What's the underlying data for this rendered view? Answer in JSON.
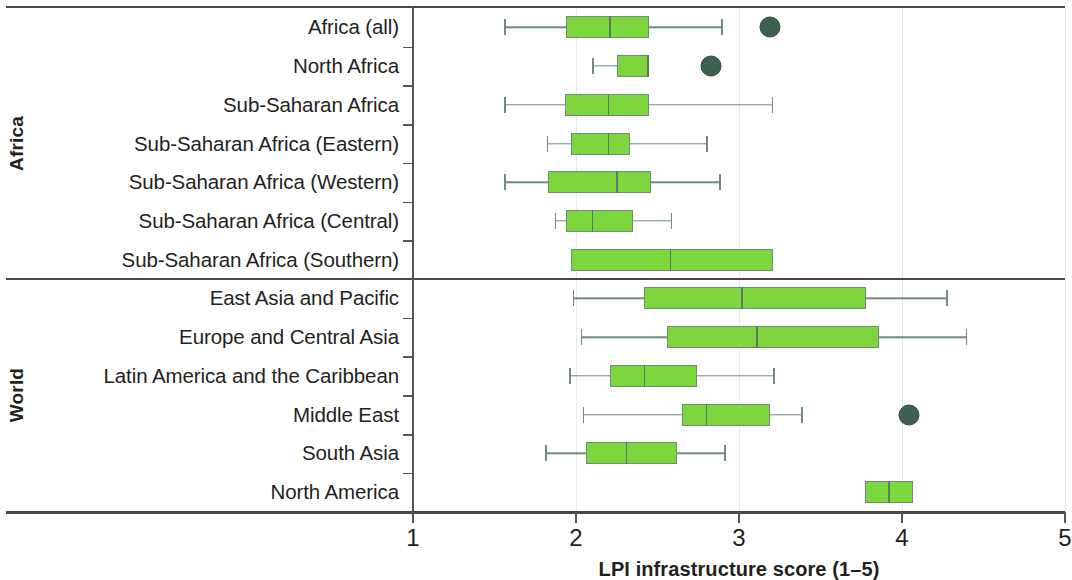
{
  "chart_data": {
    "type": "box",
    "title": "",
    "xlabel": "LPI infrastructure score (1–5)",
    "ylabel": "",
    "xlim": [
      1,
      5
    ],
    "xticks": [
      1,
      2,
      3,
      4,
      5
    ],
    "xticklabels": [
      "1",
      "2",
      "3",
      "4",
      "5"
    ],
    "grid": "vertical",
    "orientation": "horizontal",
    "colors": {
      "box_fill": "#7ed63f",
      "box_edge": "#6f8c78",
      "whisker": "#6f8c78",
      "median": "#5a7a62",
      "outlier": "#3c6150",
      "frame": "#4a4542",
      "gridline": "#e9e9ee"
    },
    "groups": [
      {
        "label": "Africa",
        "categories": [
          {
            "label": "Africa (all)",
            "whisker_low": 1.56,
            "q1": 1.94,
            "median": 2.21,
            "q3": 2.45,
            "whisker_high": 2.9,
            "outliers": [
              3.19
            ]
          },
          {
            "label": "North Africa",
            "whisker_low": 2.1,
            "q1": 2.25,
            "median": 2.44,
            "q3": 2.45,
            "whisker_high": 2.45,
            "outliers": [
              2.83
            ]
          },
          {
            "label": "Sub-Saharan Africa",
            "whisker_low": 1.56,
            "q1": 1.93,
            "median": 2.2,
            "q3": 2.45,
            "whisker_high": 3.21,
            "outliers": []
          },
          {
            "label": "Sub-Saharan Africa (Eastern)",
            "whisker_low": 1.82,
            "q1": 1.97,
            "median": 2.2,
            "q3": 2.33,
            "whisker_high": 2.81,
            "outliers": []
          },
          {
            "label": "Sub-Saharan Africa (Western)",
            "whisker_low": 1.56,
            "q1": 1.83,
            "median": 2.25,
            "q3": 2.46,
            "whisker_high": 2.89,
            "outliers": []
          },
          {
            "label": "Sub-Saharan Africa (Central)",
            "whisker_low": 1.87,
            "q1": 1.94,
            "median": 2.1,
            "q3": 2.35,
            "whisker_high": 2.59,
            "outliers": []
          },
          {
            "label": "Sub-Saharan Africa (Southern)",
            "whisker_low": 1.97,
            "q1": 1.97,
            "median": 2.58,
            "q3": 3.21,
            "whisker_high": 3.21,
            "outliers": []
          }
        ]
      },
      {
        "label": "World",
        "categories": [
          {
            "label": "East Asia and Pacific",
            "whisker_low": 1.98,
            "q1": 2.42,
            "median": 3.02,
            "q3": 3.78,
            "whisker_high": 4.28,
            "outliers": []
          },
          {
            "label": "Europe and Central Asia",
            "whisker_low": 2.03,
            "q1": 2.56,
            "median": 3.11,
            "q3": 3.86,
            "whisker_high": 4.4,
            "outliers": []
          },
          {
            "label": "Latin America and the Caribbean",
            "whisker_low": 1.96,
            "q1": 2.21,
            "median": 2.42,
            "q3": 2.74,
            "whisker_high": 3.22,
            "outliers": []
          },
          {
            "label": "Middle East",
            "whisker_low": 2.04,
            "q1": 2.65,
            "median": 2.8,
            "q3": 3.19,
            "whisker_high": 3.39,
            "outliers": [
              4.04
            ]
          },
          {
            "label": "South Asia",
            "whisker_low": 1.81,
            "q1": 2.06,
            "median": 2.31,
            "q3": 2.62,
            "whisker_high": 2.92,
            "outliers": []
          },
          {
            "label": "North America",
            "whisker_low": 3.77,
            "q1": 3.77,
            "median": 3.92,
            "q3": 4.07,
            "whisker_high": 4.07,
            "outliers": []
          }
        ]
      }
    ]
  }
}
